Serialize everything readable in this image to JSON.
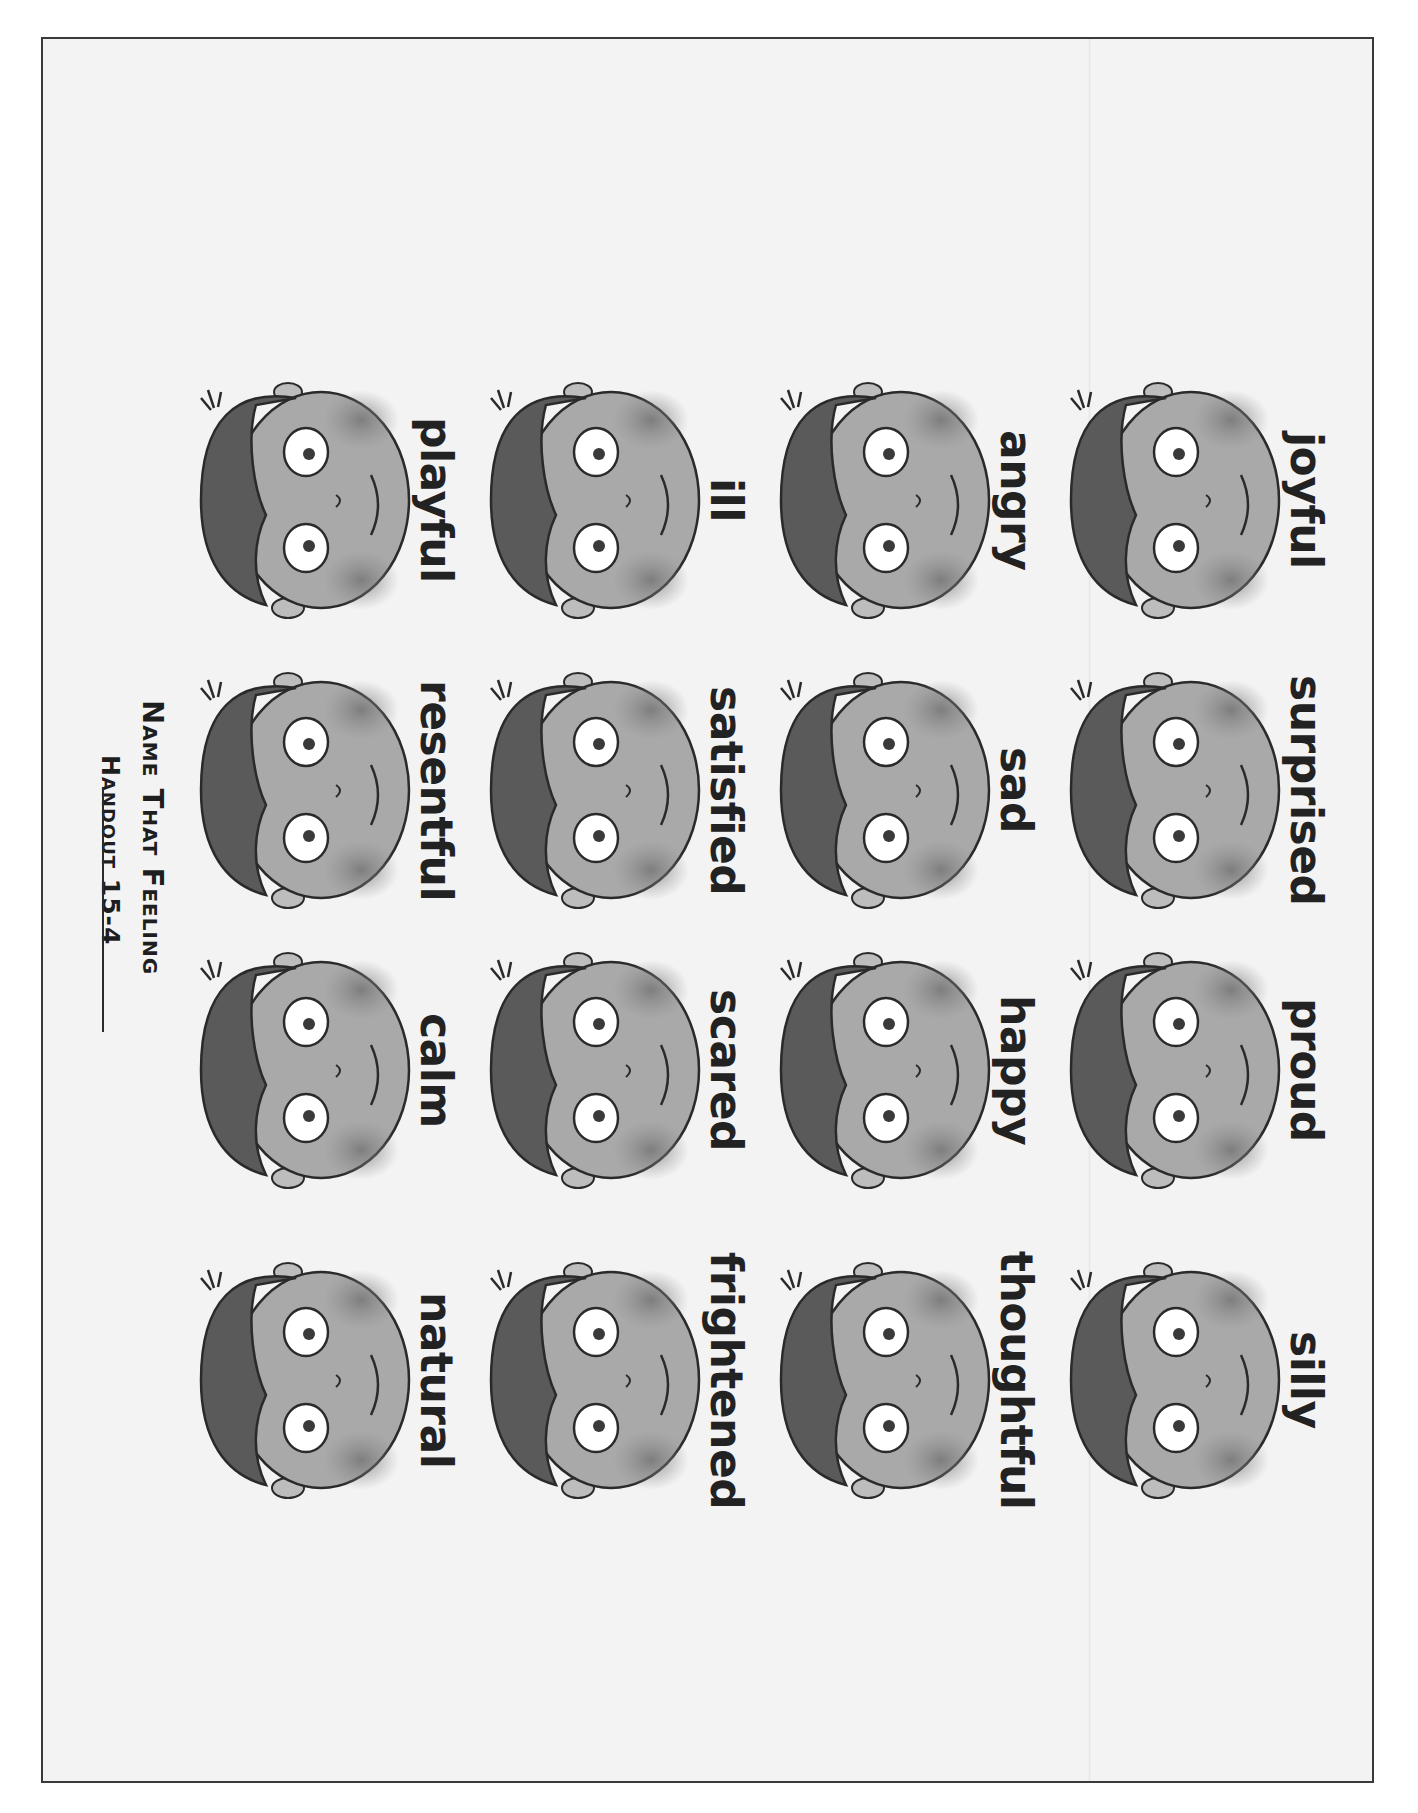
{
  "document": {
    "handout_number": "Handout 15-4",
    "title": "Name That Feeling"
  },
  "rows": [
    {
      "cells": [
        {
          "label": "natural"
        },
        {
          "label": "calm"
        },
        {
          "label": "resentful"
        },
        {
          "label": "playful"
        }
      ]
    },
    {
      "cells": [
        {
          "label": "frightened"
        },
        {
          "label": "scared"
        },
        {
          "label": "satisfied"
        },
        {
          "label": "ill"
        }
      ]
    },
    {
      "cells": [
        {
          "label": "thoughtful"
        },
        {
          "label": "happy"
        },
        {
          "label": "sad"
        },
        {
          "label": "angry"
        }
      ]
    },
    {
      "cells": [
        {
          "label": "silly"
        },
        {
          "label": "proud"
        },
        {
          "label": "surprised"
        },
        {
          "label": "joyful"
        }
      ]
    }
  ],
  "colors": {
    "page_bg": "#f3f3f3",
    "border": "#3a3a3a",
    "text": "#1e1e1e",
    "skin": "#a9a9a9",
    "hair": "#5a5a5a",
    "outline": "#2a2a2a"
  }
}
